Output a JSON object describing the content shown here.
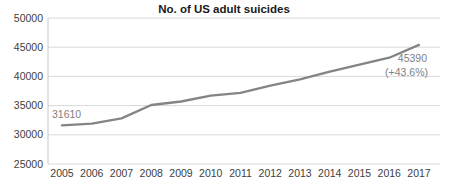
{
  "chart_data": {
    "type": "line",
    "title": "No. of US adult suicides",
    "x": [
      2005,
      2006,
      2007,
      2008,
      2009,
      2010,
      2011,
      2012,
      2013,
      2014,
      2015,
      2016,
      2017
    ],
    "x_tick_labels": [
      "2005",
      "2006",
      "2007",
      "2008",
      "2009",
      "2010",
      "2011",
      "2012",
      "2013",
      "2014",
      "2015",
      "2016",
      "2017"
    ],
    "series": [
      {
        "name": "US adult suicides",
        "values": [
          31610,
          31900,
          32800,
          35100,
          35700,
          36700,
          37200,
          38400,
          39500,
          40800,
          42000,
          43200,
          45390
        ]
      }
    ],
    "y_ticks": [
      25000,
      30000,
      35000,
      40000,
      45000,
      50000
    ],
    "y_tick_labels": [
      "25000",
      "30000",
      "35000",
      "40000",
      "45000",
      "50000"
    ],
    "ylim": [
      25000,
      50000
    ],
    "xlabel": "",
    "ylabel": "",
    "grid": "horizontal-only",
    "legend": "none",
    "annotations": {
      "start_value_label": "31610",
      "end_value_label": "45390",
      "end_change_label": "(+43.6%)"
    },
    "colors": {
      "line": "#848484",
      "grid": "#d9d9d9",
      "axis": "#c6c6c6",
      "tick_text": "#404040",
      "annotation_text": "#808080",
      "title_text": "#1a1a1a"
    }
  }
}
